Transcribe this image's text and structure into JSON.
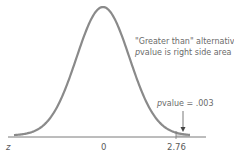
{
  "chart_data": {
    "type": "area",
    "title": "",
    "xlabel": "z",
    "ylabel": "",
    "distribution": "standard normal",
    "x_ticks": [
      {
        "value": 0,
        "label": "0"
      },
      {
        "value": 2.76,
        "label": "2.76"
      }
    ],
    "shaded_region": {
      "from": 2.76,
      "to": "infinity",
      "side": "right"
    },
    "annotations": [
      {
        "text_line1": "\"Greater than\" alternative",
        "text_line2": "pvalue is right side area"
      },
      {
        "text": "pvalue = .003",
        "points_to": 2.76
      }
    ],
    "pvalue": 0.003,
    "test_statistic": 2.76,
    "grid": false,
    "legend": "none"
  },
  "labels": {
    "axis_z": "z",
    "tick_zero": "0",
    "tick_stat": "2.76",
    "note_line1": "\"Greater than\" alternative",
    "note_line2_italic": "p",
    "note_line2_rest": "value is right side area",
    "pvalue_italic": "p",
    "pvalue_rest": "value = .003"
  },
  "colors": {
    "curve": "#8a8a8a",
    "axis": "#7a7a7a",
    "shade": "#cfcfcf",
    "text": "#5a5a5a"
  }
}
